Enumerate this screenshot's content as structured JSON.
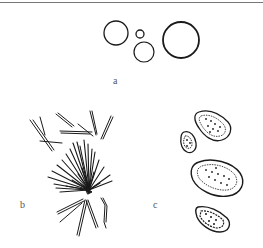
{
  "figure": {
    "panels": [
      {
        "id": "a",
        "label": "a",
        "description": "round cells / spores"
      },
      {
        "id": "b",
        "label": "b",
        "description": "needle-shaped crystals / fibers"
      },
      {
        "id": "c",
        "label": "c",
        "description": "granular oval bodies"
      }
    ]
  },
  "colors": {
    "ink": "#1a1a1a",
    "label": "#555555",
    "rule": "#777777"
  }
}
